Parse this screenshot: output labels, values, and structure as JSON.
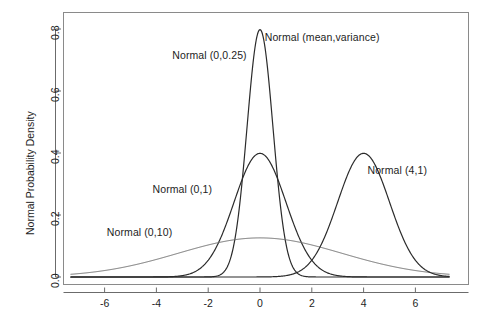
{
  "chart_data": {
    "type": "line",
    "title": "",
    "subtitle": "",
    "xlabel": "",
    "ylabel": "Normal Probability Density",
    "xlim": [
      -7.3,
      7.3
    ],
    "ylim": [
      0.0,
      0.82
    ],
    "grid": false,
    "legend_position": "inline-annotations",
    "x_ticks": [
      "-6",
      "-4",
      "-2",
      "0",
      "2",
      "4",
      "6"
    ],
    "x_tick_values": [
      -6,
      -4,
      -2,
      0,
      2,
      4,
      6
    ],
    "y_ticks": [
      "0.0",
      "0.2",
      "0.4",
      "0.6",
      "0.8"
    ],
    "y_tick_values": [
      0.0,
      0.2,
      0.4,
      0.6,
      0.8
    ],
    "series": [
      {
        "name": "Normal (0,0.25)",
        "mean": 0,
        "variance": 0.25,
        "peak_value": 0.798,
        "color": "#2b2b2b",
        "linewidth": 1.2
      },
      {
        "name": "Normal (0,1)",
        "mean": 0,
        "variance": 1,
        "peak_value": 0.399,
        "color": "#2b2b2b",
        "linewidth": 1.2
      },
      {
        "name": "Normal (0,10)",
        "mean": 0,
        "variance": 10,
        "peak_value": 0.126,
        "color": "#6e6e6e",
        "linewidth": 1.0
      },
      {
        "name": "Normal (4,1)",
        "mean": 4,
        "variance": 1,
        "peak_value": 0.399,
        "color": "#2b2b2b",
        "linewidth": 1.2
      }
    ],
    "annotations": [
      {
        "text": "Normal (mean,variance)",
        "x": 2.4,
        "y": 0.775
      },
      {
        "text": "Normal (0,0.25)",
        "x": -1.95,
        "y": 0.715
      },
      {
        "text": "Normal (0,1)",
        "x": -3.0,
        "y": 0.285
      },
      {
        "text": "Normal (0,10)",
        "x": -4.65,
        "y": 0.145
      },
      {
        "text": "Normal (4,1)",
        "x": 5.3,
        "y": 0.345
      }
    ]
  },
  "figure": {
    "background_color": "#ffffff",
    "axis_color": "#6b6b6b",
    "text_color": "#1d1d1d"
  }
}
